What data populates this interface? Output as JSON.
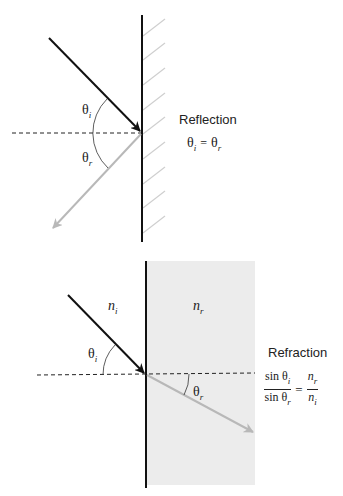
{
  "reflection": {
    "title": "Reflection",
    "equation": {
      "lhs": {
        "symbol": "θ",
        "sub": "i"
      },
      "op": "=",
      "rhs": {
        "symbol": "θ",
        "sub": "r"
      }
    },
    "angle_labels": {
      "incident": {
        "symbol": "θ",
        "sub": "i"
      },
      "reflected": {
        "symbol": "θ",
        "sub": "r"
      }
    }
  },
  "refraction": {
    "title": "Refraction",
    "media": {
      "left": {
        "symbol": "n",
        "sub": "i"
      },
      "right": {
        "symbol": "n",
        "sub": "r"
      }
    },
    "angle_labels": {
      "incident": {
        "symbol": "θ",
        "sub": "i"
      },
      "refracted": {
        "symbol": "θ",
        "sub": "r"
      }
    },
    "equation": {
      "lhs_num": "sin θ",
      "lhs_num_sub": "i",
      "lhs_den": "sin θ",
      "lhs_den_sub": "r",
      "op": "=",
      "rhs_num": "n",
      "rhs_num_sub": "r",
      "rhs_den": "n",
      "rhs_den_sub": "i"
    }
  },
  "colors": {
    "incident_ray": "#111111",
    "secondary_ray": "#b8b8b8",
    "surface": "#111111",
    "hatch": "#cfcfcf",
    "medium_fill": "#ececec",
    "normal_line": "#222222"
  }
}
